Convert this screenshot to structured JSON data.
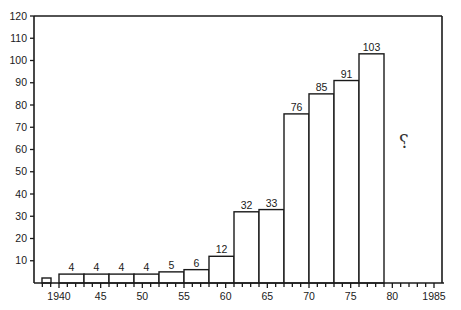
{
  "chart_data": {
    "type": "bar",
    "title": "",
    "xlabel": "",
    "ylabel": "",
    "ylim": [
      0,
      120
    ],
    "xlim": [
      1937,
      1985
    ],
    "y_ticks": [
      10,
      20,
      30,
      40,
      50,
      60,
      70,
      80,
      90,
      100,
      110,
      120
    ],
    "x_tick_labels": [
      {
        "value": 1940,
        "label": "1940"
      },
      {
        "value": 1945,
        "label": "45"
      },
      {
        "value": 1950,
        "label": "50"
      },
      {
        "value": 1955,
        "label": "55"
      },
      {
        "value": 1960,
        "label": "60"
      },
      {
        "value": 1965,
        "label": "65"
      },
      {
        "value": 1970,
        "label": "70"
      },
      {
        "value": 1975,
        "label": "75"
      },
      {
        "value": 1980,
        "label": "80"
      },
      {
        "value": 1985,
        "label": "1985"
      }
    ],
    "grid": false,
    "bars": [
      {
        "start": 1938.0,
        "end": 1939.1,
        "value": 1,
        "label": ""
      },
      {
        "start": 1940,
        "end": 1943,
        "value": 4,
        "label": "4"
      },
      {
        "start": 1943,
        "end": 1946,
        "value": 4,
        "label": "4"
      },
      {
        "start": 1946,
        "end": 1949,
        "value": 4,
        "label": "4"
      },
      {
        "start": 1949,
        "end": 1952,
        "value": 4,
        "label": "4"
      },
      {
        "start": 1952,
        "end": 1955,
        "value": 5,
        "label": "5"
      },
      {
        "start": 1955,
        "end": 1958,
        "value": 6,
        "label": "6"
      },
      {
        "start": 1958,
        "end": 1961,
        "value": 12,
        "label": "12"
      },
      {
        "start": 1961,
        "end": 1964,
        "value": 32,
        "label": "32"
      },
      {
        "start": 1964,
        "end": 1967,
        "value": 33,
        "label": "33"
      },
      {
        "start": 1967,
        "end": 1970,
        "value": 76,
        "label": "76"
      },
      {
        "start": 1970,
        "end": 1973,
        "value": 85,
        "label": "85"
      },
      {
        "start": 1973,
        "end": 1976,
        "value": 91,
        "label": "91"
      },
      {
        "start": 1976,
        "end": 1979,
        "value": 103,
        "label": "103"
      }
    ],
    "categories": [
      "1940-43",
      "1943-46",
      "1946-49",
      "1949-52",
      "1952-55",
      "1955-58",
      "1958-61",
      "1961-64",
      "1964-67",
      "1967-70",
      "1970-73",
      "1973-76",
      "1976-79"
    ],
    "values": [
      4,
      4,
      4,
      4,
      5,
      6,
      12,
      32,
      33,
      76,
      85,
      91,
      103
    ],
    "annotations": [
      {
        "text": "?",
        "x": 1982,
        "y": 68,
        "note": "handwritten question mark for the period after 1979"
      }
    ]
  },
  "colors": {
    "ink": "#1a1a1a",
    "background": "#ffffff",
    "bar_fill": "#ffffff"
  }
}
